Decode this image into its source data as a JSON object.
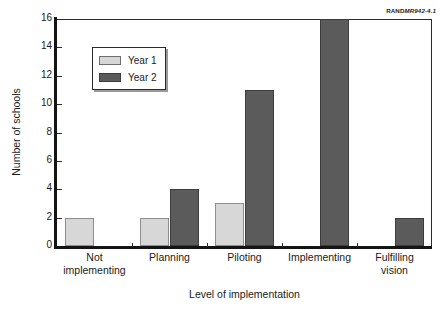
{
  "corner_tag": {
    "brand": "RAND",
    "document": "MR942-4.1"
  },
  "chart_data": {
    "type": "bar",
    "title": "",
    "subtitle": "",
    "xlabel": "Level of implementation",
    "ylabel": "Number of schools",
    "categories": [
      "Not\nimplementing",
      "Planning",
      "Piloting",
      "Implementing",
      "Fulfilling\nvision"
    ],
    "category_labels": [
      [
        "Not",
        "implementing"
      ],
      [
        "Planning"
      ],
      [
        "Piloting"
      ],
      [
        "Implementing"
      ],
      [
        "Fulfilling",
        "vision"
      ]
    ],
    "series": [
      {
        "name": "Year 1",
        "color": "#d7d7d7",
        "values": [
          2,
          2,
          3,
          0,
          0
        ]
      },
      {
        "name": "Year 2",
        "color": "#5b5b5b",
        "values": [
          0,
          4,
          11,
          16,
          2
        ]
      }
    ],
    "ylim": [
      0,
      16
    ],
    "yticks": [
      0,
      2,
      4,
      6,
      8,
      10,
      12,
      14,
      16
    ],
    "ytick_labels": [
      "0",
      "2",
      "4",
      "6",
      "8",
      "10",
      "12",
      "14",
      "16"
    ],
    "grid": false,
    "legend_position": "upper-left",
    "legend_entries": [
      "Year 1",
      "Year 2"
    ]
  }
}
